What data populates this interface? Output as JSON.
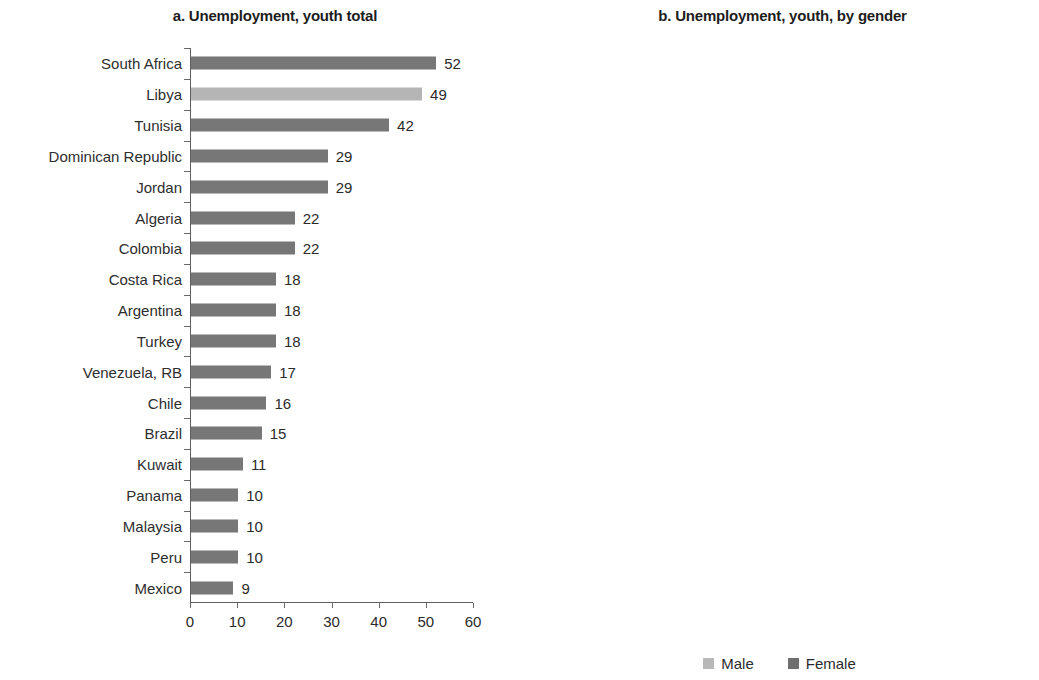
{
  "panels": {
    "a": {
      "title": "a. Unemployment, youth total",
      "xaxis": {
        "min": 0,
        "max": 60,
        "ticks": [
          "0",
          "10",
          "20",
          "30",
          "40",
          "50",
          "60"
        ]
      }
    },
    "b": {
      "title": "b. Unemployment, youth, by gender",
      "xaxis": {
        "min": 0,
        "max": 80,
        "ticks": [
          "0",
          "20",
          "40",
          "60",
          "80"
        ]
      }
    }
  },
  "legend": {
    "items": [
      {
        "label": "Male",
        "color": "#b8b8b8",
        "swatch": "male"
      },
      {
        "label": "Female",
        "color": "#6f6f6f",
        "swatch": "female"
      }
    ]
  },
  "colors": {
    "bar_total": "#777777",
    "bar_total_highlight": "#b5b5b5",
    "bar_male": "#b8b8b8",
    "bar_female": "#717171",
    "axis": "#5f5f5f",
    "text": "#2b2b2b"
  },
  "chart_data": [
    {
      "type": "bar",
      "orientation": "horizontal",
      "title": "a. Unemployment, youth total",
      "xlabel": "",
      "ylabel": "",
      "xlim": [
        0,
        60
      ],
      "xticks": [
        0,
        10,
        20,
        30,
        40,
        50,
        60
      ],
      "grid": false,
      "data_labels": true,
      "categories": [
        "South Africa",
        "Libya",
        "Tunisia",
        "Dominican Republic",
        "Jordan",
        "Algeria",
        "Colombia",
        "Costa Rica",
        "Argentina",
        "Turkey",
        "Venezuela, RB",
        "Chile",
        "Brazil",
        "Kuwait",
        "Panama",
        "Malaysia",
        "Peru",
        "Mexico"
      ],
      "values": [
        52,
        49,
        42,
        29,
        29,
        22,
        22,
        18,
        18,
        18,
        17,
        16,
        15,
        11,
        10,
        10,
        10,
        9
      ],
      "labels": [
        "52",
        "49",
        "42",
        "29",
        "29",
        "22",
        "22",
        "18",
        "18",
        "18",
        "17",
        "16",
        "15",
        "11",
        "10",
        "10",
        "10",
        "9"
      ],
      "highlighted": [
        "Libya"
      ]
    },
    {
      "type": "bar",
      "orientation": "horizontal",
      "title": "b. Unemployment, youth, by gender",
      "xlabel": "",
      "ylabel": "",
      "xlim": [
        0,
        80
      ],
      "xticks": [
        0,
        20,
        40,
        60,
        80
      ],
      "grid": false,
      "data_labels": false,
      "legend_position": "bottom",
      "categories": [
        "South Africa",
        "Libya",
        "Tunisia",
        "Dominican Republic",
        "Jordan",
        "Algeria",
        "Colombia",
        "Costa Rica",
        "Argentina",
        "Turkey",
        "Venezuela, RB",
        "Chile",
        "Brazil",
        "Kuwait",
        "Panama",
        "Malaysia",
        "Peru",
        "Mexico"
      ],
      "series": [
        {
          "name": "Male",
          "values": [
            48,
            42,
            33,
            24,
            26,
            20,
            18,
            16,
            17,
            17,
            15,
            18,
            13,
            12,
            10,
            10,
            10,
            10
          ]
        },
        {
          "name": "Female",
          "values": [
            58,
            68,
            31,
            42,
            50,
            39,
            29,
            25,
            24,
            21,
            23,
            19,
            20,
            11,
            14,
            12,
            10,
            10
          ]
        }
      ]
    }
  ]
}
